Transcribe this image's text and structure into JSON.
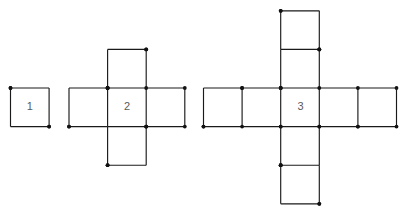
{
  "page": {
    "background_color": "#ffffff",
    "width": 407,
    "height": 218
  },
  "style": {
    "stick_color": "#1a1a1a",
    "head_color": "#111111",
    "label_color": "#5a5a5a",
    "stick_width": 1.15,
    "head_radius": 1.9,
    "cell_size": 38.6
  },
  "figures": [
    {
      "id": "figure-1",
      "label": "1",
      "square_count": 1,
      "matchstick_count": 4,
      "origin": {
        "x": 10.5,
        "y": 88.0
      },
      "label_pos": {
        "x": 29.8,
        "y": 107.3
      },
      "cells": [
        {
          "col": 0,
          "row": 0
        }
      ]
    },
    {
      "id": "figure-2",
      "label": "2",
      "square_count": 5,
      "matchstick_count": 16,
      "origin": {
        "x": 69.0,
        "y": 49.4
      },
      "label_pos": {
        "x": 127.0,
        "y": 107.3
      },
      "cells": [
        {
          "col": 1,
          "row": 0
        },
        {
          "col": 0,
          "row": 1
        },
        {
          "col": 1,
          "row": 1
        },
        {
          "col": 2,
          "row": 1
        },
        {
          "col": 1,
          "row": 2
        }
      ]
    },
    {
      "id": "figure-3",
      "label": "3",
      "square_count": 13,
      "matchstick_count": 36,
      "origin": {
        "x": 203.5,
        "y": 10.8
      },
      "label_pos": {
        "x": 300.5,
        "y": 107.3
      },
      "cells": [
        {
          "col": 2,
          "row": 0
        },
        {
          "col": 2,
          "row": 1
        },
        {
          "col": 0,
          "row": 2
        },
        {
          "col": 1,
          "row": 2
        },
        {
          "col": 2,
          "row": 2
        },
        {
          "col": 3,
          "row": 2
        },
        {
          "col": 4,
          "row": 2
        },
        {
          "col": 2,
          "row": 3
        },
        {
          "col": 2,
          "row": 4
        }
      ]
    }
  ]
}
